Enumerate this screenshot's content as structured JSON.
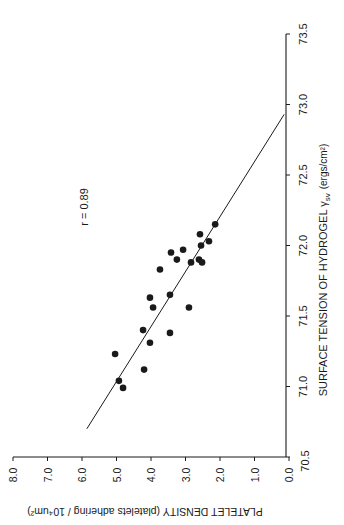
{
  "chart_data": {
    "type": "scatter",
    "orientation_note": "figure printed rotated 90 degrees clockwise",
    "xlabel": "PLATELET DENSITY (platelets adhering / 10⁴um²)",
    "ylabel": "SURFACE TENSION OF  HYDROGEL  γsv (ergs/cm²)",
    "xlim": [
      0.0,
      8.0
    ],
    "ylim": [
      70.5,
      73.5
    ],
    "x_ticks": [
      "0.0",
      "1.0",
      "2.0",
      "3.0",
      "4.0",
      "5.0",
      "6.0",
      "7.0",
      "8.0"
    ],
    "y_ticks": [
      "70.5",
      "71.0",
      "71.5",
      "72.0",
      "72.5",
      "73.0",
      "73.5"
    ],
    "grid": false,
    "annotation": "r = 0.89",
    "points": [
      {
        "x": 2.14,
        "y": 72.15
      },
      {
        "x": 2.58,
        "y": 72.08
      },
      {
        "x": 2.32,
        "y": 72.03
      },
      {
        "x": 2.55,
        "y": 72.0
      },
      {
        "x": 3.07,
        "y": 71.97
      },
      {
        "x": 3.42,
        "y": 71.95
      },
      {
        "x": 3.25,
        "y": 71.9
      },
      {
        "x": 2.61,
        "y": 71.9
      },
      {
        "x": 2.52,
        "y": 71.88
      },
      {
        "x": 2.84,
        "y": 71.88
      },
      {
        "x": 3.74,
        "y": 71.83
      },
      {
        "x": 4.03,
        "y": 71.63
      },
      {
        "x": 3.45,
        "y": 71.65
      },
      {
        "x": 3.94,
        "y": 71.56
      },
      {
        "x": 2.9,
        "y": 71.56
      },
      {
        "x": 4.23,
        "y": 71.4
      },
      {
        "x": 3.45,
        "y": 71.38
      },
      {
        "x": 4.03,
        "y": 71.31
      },
      {
        "x": 5.04,
        "y": 71.23
      },
      {
        "x": 4.2,
        "y": 71.12
      },
      {
        "x": 4.93,
        "y": 71.04
      },
      {
        "x": 4.81,
        "y": 70.99
      }
    ],
    "regression_line": {
      "x1": 5.86,
      "y1": 70.7,
      "x2": 0.14,
      "y2": 72.93
    }
  },
  "labels": {
    "r_value": "r = 0.89",
    "x_axis_title": "PLATELET DENSITY (platelets adhering / 10⁴um²)",
    "y_axis_title_main": "SURFACE TENSION OF  HYDROGEL  γ",
    "y_axis_title_sub": "sv",
    "y_axis_title_unit": "(ergs/cm²)"
  },
  "colors": {
    "ink": "#1a1a1a",
    "background": "#ffffff"
  }
}
